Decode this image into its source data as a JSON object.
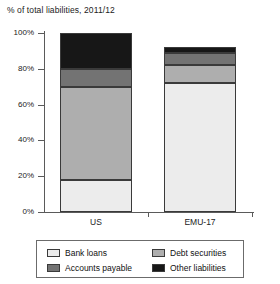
{
  "chart_data": {
    "type": "bar",
    "title": "% of total liabilities, 2011/12",
    "subtitle": "",
    "xlabel": "",
    "ylabel": "",
    "stacked": true,
    "grid": false,
    "legend_position": "bottom",
    "categories": [
      "US",
      "EMU-17"
    ],
    "ylim": [
      0,
      100
    ],
    "yticks": [
      0,
      20,
      40,
      60,
      80,
      100
    ],
    "ytick_labels": [
      "0%",
      "20%",
      "40%",
      "60%",
      "80%",
      "100%"
    ],
    "series": [
      {
        "name": "Bank loans",
        "color": "#ececec",
        "values": [
          18,
          72
        ]
      },
      {
        "name": "Accounts payable",
        "color": "#aeaeae",
        "values": [
          52,
          10
        ]
      },
      {
        "name": "Debt securities",
        "color": "#737373",
        "values": [
          10,
          7
        ]
      },
      {
        "name": "Other liabilities",
        "color": "#171717",
        "values": [
          20,
          3
        ]
      }
    ],
    "legend_entries": [
      {
        "label": "Bank loans",
        "color": "#ececec"
      },
      {
        "label": "Debt securities",
        "color": "#aeaeae"
      },
      {
        "label": "Accounts payable",
        "color": "#737373"
      },
      {
        "label": "Other liabilities",
        "color": "#171717"
      }
    ]
  }
}
